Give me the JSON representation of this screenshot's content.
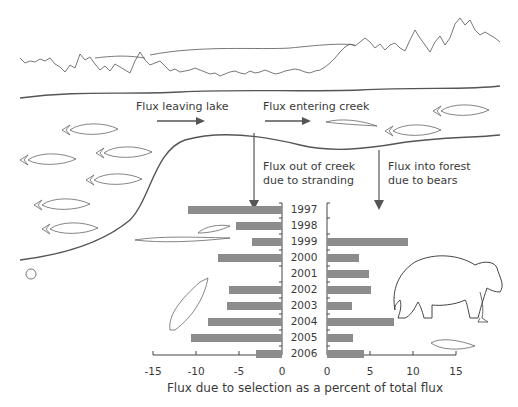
{
  "diagram": {
    "labels": {
      "flux_leaving_lake": "Flux leaving lake",
      "flux_entering_creek": "Flux entering creek",
      "flux_out_of_creek_1": "Flux out of creek",
      "flux_out_of_creek_2": "due to stranding",
      "flux_into_forest_1": "Flux into forest",
      "flux_into_forest_2": "due to bears"
    }
  },
  "chart_data": {
    "type": "bar",
    "orientation": "horizontal",
    "title": "",
    "xlabel": "Flux due to selection as a percent of total flux",
    "ylabel": "",
    "categories": [
      "1997",
      "1998",
      "1999",
      "2000",
      "2001",
      "2002",
      "2003",
      "2004",
      "2005",
      "2006"
    ],
    "series": [
      {
        "name": "Flux out of creek due to stranding",
        "panel": "left",
        "values": [
          -10.9,
          -5.3,
          -3.5,
          -7.4,
          0,
          -6.2,
          -6.4,
          -8.6,
          -10.6,
          -3.0
        ]
      },
      {
        "name": "Flux into forest due to bears",
        "panel": "right",
        "values": [
          0,
          0,
          9.4,
          3.7,
          4.9,
          5.1,
          2.9,
          7.8,
          3.0,
          4.3
        ]
      }
    ],
    "left_axis": {
      "ticks": [
        "-15",
        "-10",
        "-5",
        "0"
      ],
      "range": [
        -15,
        0
      ]
    },
    "right_axis": {
      "ticks": [
        "0",
        "5",
        "10",
        "15"
      ],
      "range": [
        0,
        15
      ]
    },
    "grid": false,
    "legend": "none",
    "bar_color": "#8c8c8c"
  }
}
